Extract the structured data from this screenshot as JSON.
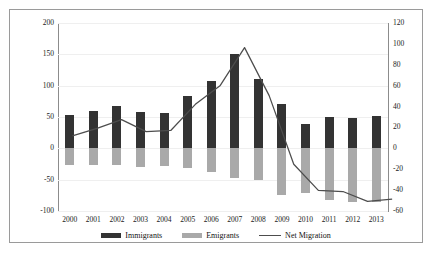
{
  "figure": {
    "title_fragment": "",
    "legend_items": [
      {
        "key": "immigrants",
        "label": "Immigrants",
        "swatch": "dark",
        "color": "#333333"
      },
      {
        "key": "emigrants",
        "label": "Emigrants",
        "swatch": "gray",
        "color": "#a9a9a9"
      },
      {
        "key": "net_migration",
        "label": "Net Migration",
        "swatch": "line",
        "color": "#4d4d4d"
      }
    ]
  },
  "chart_data": {
    "type": "bar",
    "title": "",
    "subtitle": "",
    "xlabel": "",
    "ylabel": "",
    "grid": false,
    "legend_position": "bottom",
    "categories": [
      "2000",
      "2001",
      "2002",
      "2003",
      "2004",
      "2005",
      "2006",
      "2007",
      "2008",
      "2009",
      "2010",
      "2011",
      "2012",
      "2013"
    ],
    "primary_axis": {
      "side": "left",
      "ylim": [
        -100,
        200
      ],
      "ticks": [
        200,
        150,
        100,
        50,
        0,
        -50,
        -100
      ],
      "tick_labels": [
        "200",
        "150",
        "100",
        "50",
        "0",
        "-50",
        "-100"
      ]
    },
    "secondary_axis": {
      "side": "right",
      "ylim": [
        -60,
        120
      ],
      "ticks": [
        120,
        100,
        80,
        60,
        40,
        20,
        0,
        -20,
        -40,
        -60
      ],
      "tick_labels": [
        "120",
        "100",
        "80",
        "60",
        "40",
        "20",
        "0",
        "-20",
        "-40",
        "-60"
      ]
    },
    "series": [
      {
        "name": "Immigrants",
        "type": "bar",
        "axis": "left",
        "color": "#333333",
        "values": [
          53,
          59,
          67,
          58,
          56,
          84,
          107,
          151,
          110,
          71,
          39,
          50,
          49,
          52
        ]
      },
      {
        "name": "Emigrants",
        "type": "bar",
        "axis": "left",
        "color": "#a9a9a9",
        "values": [
          -27,
          -27,
          -26,
          -30,
          -28,
          -31,
          -37,
          -47,
          -50,
          -74,
          -71,
          -82,
          -86,
          -86
        ]
      },
      {
        "name": "Net Migration",
        "type": "line",
        "axis": "right",
        "color": "#4d4d4d",
        "values": [
          26,
          33,
          41,
          30,
          31,
          55,
          72,
          107,
          63,
          0,
          -24,
          -25,
          -34,
          -32
        ]
      }
    ]
  }
}
